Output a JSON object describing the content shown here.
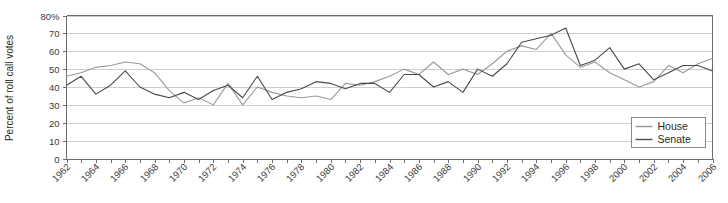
{
  "chart_data": {
    "type": "line",
    "title": "",
    "xlabel": "",
    "ylabel": "Percent of roll call votes",
    "ylim": [
      0,
      80
    ],
    "xlim": [
      1962,
      2006
    ],
    "ytick_values": [
      0,
      10,
      20,
      30,
      40,
      50,
      60,
      70,
      80
    ],
    "ytick_labels": [
      "0",
      "10",
      "20",
      "30",
      "40",
      "50",
      "60",
      "70",
      "80%"
    ],
    "xtick_labels": [
      "1962",
      "1964",
      "1966",
      "1968",
      "1970",
      "1972",
      "1974",
      "1976",
      "1978",
      "1980",
      "1982",
      "1984",
      "1986",
      "1988",
      "1990",
      "1992",
      "1994",
      "1996",
      "1998",
      "2000",
      "2002",
      "2004",
      "2006"
    ],
    "grid": true,
    "legend_position": "bottom-right",
    "x": [
      1962,
      1963,
      1964,
      1965,
      1966,
      1967,
      1968,
      1969,
      1970,
      1971,
      1972,
      1973,
      1974,
      1975,
      1976,
      1977,
      1978,
      1979,
      1980,
      1981,
      1982,
      1983,
      1984,
      1985,
      1986,
      1987,
      1988,
      1989,
      1990,
      1991,
      1992,
      1993,
      1994,
      1995,
      1996,
      1997,
      1998,
      1999,
      2000,
      2001,
      2002,
      2003,
      2004,
      2005,
      2006
    ],
    "series": [
      {
        "name": "House",
        "color": "#9a9a9a",
        "values": [
          46,
          48,
          51,
          52,
          54,
          53,
          48,
          38,
          31,
          34,
          30,
          42,
          30,
          40,
          37,
          35,
          34,
          35,
          33,
          42,
          41,
          43,
          46,
          50,
          47,
          54,
          47,
          50,
          47,
          53,
          60,
          63,
          61,
          70,
          58,
          51,
          54,
          48,
          44,
          40,
          43,
          52,
          48,
          53,
          56
        ]
      },
      {
        "name": "Senate",
        "color": "#4a4a4a",
        "values": [
          41,
          46,
          36,
          41,
          49,
          40,
          36,
          34,
          37,
          33,
          38,
          41,
          34,
          46,
          33,
          37,
          39,
          43,
          42,
          39,
          42,
          42,
          37,
          47,
          47,
          40,
          43,
          37,
          50,
          46,
          53,
          65,
          67,
          69,
          73,
          52,
          55,
          62,
          50,
          53,
          44,
          48,
          52,
          52,
          49
        ]
      }
    ]
  },
  "legend": {
    "items": [
      {
        "label": "House"
      },
      {
        "label": "Senate"
      }
    ]
  }
}
